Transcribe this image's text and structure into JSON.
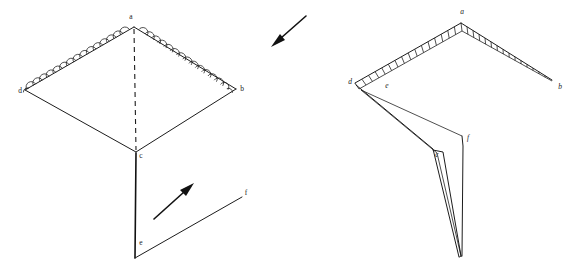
{
  "figure": {
    "background_color": "#ffffff",
    "ink_color": "#1c1c1c",
    "panels": [
      {
        "id": "left-panel",
        "name": "unfolded-open-state",
        "description": "Open rhombus frame with scalloped upper edges, dashed vertical axis and a lower V limb",
        "vertices": [
          {
            "label": "a",
            "x": 134,
            "y": 22,
            "style": "plain"
          },
          {
            "label": "d",
            "x": 22,
            "y": 90,
            "style": "plain"
          },
          {
            "label": "b",
            "x": 240,
            "y": 88,
            "style": "plain"
          },
          {
            "label": "c",
            "x": 140,
            "y": 155,
            "style": "plain"
          },
          {
            "label": "e",
            "x": 140,
            "y": 242,
            "style": "plain"
          },
          {
            "label": "f",
            "x": 245,
            "y": 192,
            "style": "plain"
          }
        ]
      },
      {
        "id": "right-panel",
        "name": "folded-collapsed-state",
        "description": "Collapsed chevron with ribbed band along the top edges and a narrow folded lower limb",
        "vertices": [
          {
            "label": "a",
            "x": 462,
            "y": 16,
            "style": "italic"
          },
          {
            "label": "d",
            "x": 352,
            "y": 81,
            "style": "italic"
          },
          {
            "label": "e",
            "x": 387,
            "y": 85,
            "style": "italic"
          },
          {
            "label": "b",
            "x": 559,
            "y": 86,
            "style": "italic"
          },
          {
            "label": "c",
            "x": 438,
            "y": 155,
            "style": "italic"
          },
          {
            "label": "f",
            "x": 467,
            "y": 139,
            "style": "italic"
          }
        ]
      }
    ],
    "arrows": [
      {
        "name": "fold-direction-arrow-upper",
        "from": {
          "x": 306,
          "y": 16
        },
        "to": {
          "x": 272,
          "y": 46
        },
        "direction": "down-left"
      },
      {
        "name": "fold-direction-arrow-lower",
        "from": {
          "x": 154,
          "y": 219
        },
        "to": {
          "x": 193,
          "y": 184
        },
        "direction": "up-right"
      }
    ],
    "edge_decoration": {
      "left_panel": "scalloped-arches",
      "right_panel": "ribbed-band"
    }
  }
}
